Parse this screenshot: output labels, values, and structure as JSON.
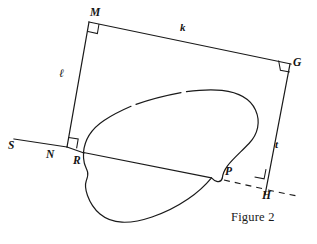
{
  "figure": {
    "caption": "Figure 2",
    "caption_pos": {
      "x": 231,
      "y": 210
    },
    "stroke_color": "#1a1a1a",
    "background_color": "#ffffff",
    "width": 317,
    "height": 244
  },
  "vertices": [
    {
      "id": "M",
      "label": "M",
      "x": 89,
      "y": 22,
      "label_x": 90,
      "label_y": 7,
      "right_angle": true
    },
    {
      "id": "G",
      "label": "G",
      "x": 290,
      "y": 64,
      "label_x": 293,
      "label_y": 58,
      "right_angle": true
    },
    {
      "id": "N",
      "label": "N",
      "x": 67,
      "y": 146,
      "label_x": 47,
      "label_y": 150,
      "right_angle": true
    },
    {
      "id": "H",
      "label": "H",
      "x": 265,
      "y": 188,
      "label_x": 263,
      "label_y": 190,
      "right_angle": true
    },
    {
      "id": "R",
      "label": "R",
      "x": 82,
      "y": 153,
      "label_x": 73,
      "label_y": 154,
      "right_angle": false
    },
    {
      "id": "P",
      "label": "P",
      "x": 222,
      "y": 178,
      "label_x": 224,
      "label_y": 166,
      "right_angle": false
    },
    {
      "id": "S",
      "label": "S",
      "x": 14,
      "y": 140,
      "label_x": 9,
      "label_y": 142,
      "right_angle": false
    }
  ],
  "side_labels": [
    {
      "id": "k",
      "label": "k",
      "x": 180,
      "y": 23,
      "script": false
    },
    {
      "id": "l",
      "label": "ℓ",
      "x": 60,
      "y": 69,
      "script": true
    },
    {
      "id": "t",
      "label": "t",
      "x": 275,
      "y": 140,
      "script": false
    }
  ],
  "segments": [
    {
      "name": "segment-MG",
      "from": "M",
      "to": "G",
      "style": "solid"
    },
    {
      "name": "segment-MN",
      "from": "M",
      "to": "N",
      "style": "solid"
    },
    {
      "name": "segment-GH",
      "from": "G",
      "to": "H",
      "style": "solid"
    },
    {
      "name": "segment-SN-ray",
      "from": "S",
      "to": "N",
      "style": "solid"
    },
    {
      "name": "segment-NR",
      "from": "N",
      "to": "R",
      "style": "solid"
    },
    {
      "name": "segment-PH",
      "from": "P",
      "to": "H",
      "style": "dashed"
    },
    {
      "name": "segment-H-extension",
      "from": "H",
      "to": "east",
      "style": "dashed"
    }
  ],
  "region": {
    "name": "irregular-land-parcel",
    "description": "closed freeform curve touching R and P"
  }
}
